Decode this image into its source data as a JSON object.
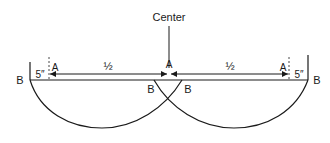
{
  "diagram": {
    "center_label": "Center",
    "left_edge_label": "B",
    "right_edge_label": "B",
    "left_offset_label": "5″",
    "right_offset_label": "5″",
    "left_point_a": "A",
    "center_point_a": "A",
    "right_point_a": "A",
    "left_half_label": "½",
    "right_half_label": "½",
    "left_arc_end_label": "B",
    "right_arc_end_label": "B",
    "stroke_color": "#1a1a1a"
  }
}
